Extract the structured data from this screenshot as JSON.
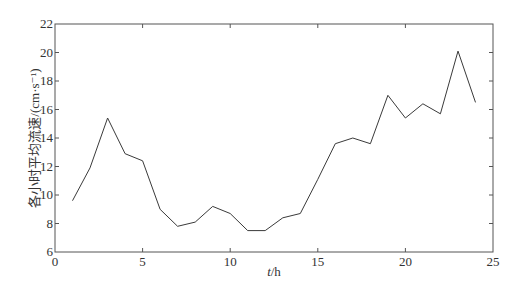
{
  "chart_data": {
    "type": "line",
    "title": "",
    "xlabel": "t/h",
    "xlabel_italic": "t",
    "xlabel_rest": "/h",
    "ylabel": "各小时平均流速/(cm·s⁻¹)",
    "xlim": [
      0,
      25
    ],
    "ylim": [
      6,
      22
    ],
    "xticks": [
      0,
      5,
      10,
      15,
      20,
      25
    ],
    "yticks": [
      6,
      8,
      10,
      12,
      14,
      16,
      18,
      20,
      22
    ],
    "grid": false,
    "legend": null,
    "line_color": "#3a3a3a",
    "series": [
      {
        "name": "hourly mean velocity",
        "x": [
          1,
          2,
          3,
          4,
          5,
          6,
          7,
          8,
          9,
          10,
          11,
          12,
          13,
          14,
          15,
          16,
          17,
          18,
          19,
          20,
          21,
          22,
          23,
          24
        ],
        "values": [
          9.6,
          11.9,
          15.4,
          12.9,
          12.4,
          9.0,
          7.8,
          8.1,
          9.2,
          8.7,
          7.5,
          7.5,
          8.4,
          8.7,
          11.1,
          13.6,
          14.0,
          13.6,
          17.0,
          15.4,
          16.4,
          15.7,
          20.1,
          16.5
        ]
      }
    ]
  }
}
